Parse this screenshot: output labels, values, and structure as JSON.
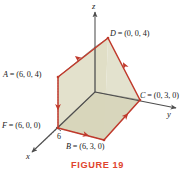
{
  "figure": {
    "caption": "FIGURE 19",
    "caption_color": "#e0442e",
    "edge_color": "#c0392b",
    "fill_color": "#d9d7bc",
    "fill_color_light": "#e4e2ce",
    "axis_color": "#4d4d4d",
    "background": "#ffffff"
  },
  "axes": [
    {
      "name": "z-axis",
      "label": "z",
      "direction": "up"
    },
    {
      "name": "y-axis",
      "label": "y",
      "direction": "right"
    },
    {
      "name": "x-axis",
      "label": "x",
      "direction": "lower-left"
    }
  ],
  "ticks": [
    {
      "name": "x-tick-6",
      "label": "6",
      "axis": "x",
      "value": 6
    }
  ],
  "vertices": [
    {
      "id": "D",
      "label": "D = (0, 0, 4)",
      "coords": [
        0,
        0,
        4
      ],
      "px": [
        108,
        38
      ]
    },
    {
      "id": "A",
      "label": "A = (6, 0, 4)",
      "coords": [
        6,
        0,
        4
      ],
      "px": [
        58,
        77
      ]
    },
    {
      "id": "C",
      "label": "C = (0, 3, 0)",
      "coords": [
        0,
        3,
        0
      ],
      "px": [
        140,
        100
      ]
    },
    {
      "id": "F",
      "label": "F = (6, 0, 0)",
      "coords": [
        6,
        0,
        0
      ],
      "px": [
        58,
        128
      ]
    },
    {
      "id": "B",
      "label": "B = (6, 3, 0)",
      "coords": [
        6,
        3,
        0
      ],
      "px": [
        104,
        140
      ]
    }
  ],
  "chart_data": {
    "type": "scatter",
    "title": "FIGURE 19",
    "xlabel": "x",
    "ylabel": "y",
    "zlabel": "z",
    "points": [
      {
        "name": "A",
        "x": 6,
        "y": 0,
        "z": 4
      },
      {
        "name": "B",
        "x": 6,
        "y": 3,
        "z": 0
      },
      {
        "name": "C",
        "x": 0,
        "y": 3,
        "z": 0
      },
      {
        "name": "D",
        "x": 0,
        "y": 0,
        "z": 4
      },
      {
        "name": "F",
        "x": 6,
        "y": 0,
        "z": 0
      }
    ],
    "oriented_boundary": [
      "D",
      "A",
      "F",
      "B",
      "C",
      "D"
    ],
    "grid": false,
    "legend": "none"
  }
}
